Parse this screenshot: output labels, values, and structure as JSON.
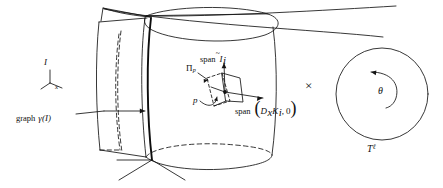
{
  "figure": {
    "background_color": "#ffffff",
    "ink_color": "#101010",
    "width": 443,
    "height": 188
  },
  "labels": {
    "interval_axis": {
      "vertical_label": "I",
      "horizontal_label": "x"
    },
    "graph_curve": {
      "text_prefix": "graph",
      "symbol": "γ(I)",
      "full": "graph γ(I)"
    },
    "plane_at_p": {
      "symbol": "Π",
      "subscript": "p",
      "full": "Πp"
    },
    "point_p": "p",
    "span_vertical": {
      "prefix": "span",
      "symbol": "I",
      "accent": "~",
      "subscript": "i",
      "full": "span Ĩi"
    },
    "span_horizontal": {
      "prefix": "span",
      "open_paren": "(",
      "term_1_operator": "D",
      "term_1_operator_sub": "x",
      "term_1_field": "K",
      "term_1_field_sub": "i",
      "separator": ",",
      "term_2": "0",
      "close_paren": ")",
      "full": "span (DxKi, 0)"
    },
    "product_symbol": "×",
    "torus_angle": "θ",
    "torus_name": {
      "symbol": "T",
      "superscript": "ℓ",
      "full": "Tℓ"
    }
  },
  "geometry": {
    "cylinder": {
      "description": "vertical tube surface with elliptical top and bottom rims",
      "left_edge_x": 143,
      "right_edge_x": 272,
      "top_y": 14,
      "bottom_y": 160
    },
    "highlighted_curve": {
      "description": "thick vertical curve on the cylinder, the graph of gamma",
      "stroke_width": 1.9
    },
    "left_sheet": {
      "description": "flat quadrilateral sheet attached at left of cylinder"
    },
    "tangent_frame": {
      "point_x": 225,
      "point_y": 92,
      "vertical_arrow_label": "span Ĩi",
      "horizontal_arrow_label": "span (DxKi, 0)"
    },
    "circle": {
      "center_x": 382,
      "center_y": 94,
      "radius": 46,
      "arc_arrow": "counterclockwise"
    }
  }
}
